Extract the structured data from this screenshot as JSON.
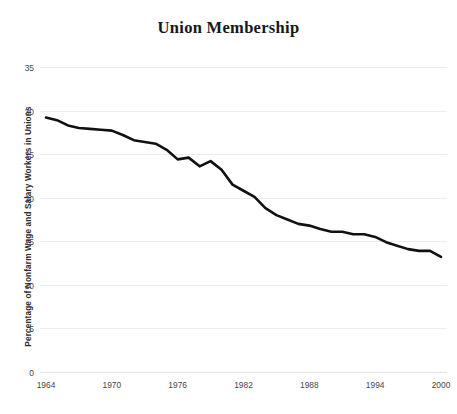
{
  "chart_data": {
    "type": "line",
    "title": "Union Membership",
    "xlabel": "",
    "ylabel": "Percentage of Nonfarm Wage and Salary Workers in Unions",
    "xlim": [
      1964,
      2000
    ],
    "ylim": [
      0,
      35
    ],
    "grid": true,
    "legend": false,
    "y_ticks": [
      0,
      5,
      10,
      15,
      20,
      25,
      30,
      35
    ],
    "y_tick_labels": [
      "0",
      "5",
      "10",
      "15",
      "20",
      "25",
      "30",
      "35"
    ],
    "x_ticks": [
      1964,
      1970,
      1976,
      1982,
      1988,
      1994,
      2000
    ],
    "x_tick_labels": [
      "1964",
      "1970",
      "1976",
      "1982",
      "1988",
      "1994",
      "2000"
    ],
    "series": [
      {
        "name": "Union Membership",
        "color": "#111111",
        "x": [
          1964,
          1965,
          1966,
          1967,
          1968,
          1969,
          1970,
          1971,
          1972,
          1973,
          1974,
          1975,
          1976,
          1977,
          1978,
          1979,
          1980,
          1981,
          1982,
          1983,
          1984,
          1985,
          1986,
          1987,
          1988,
          1989,
          1990,
          1991,
          1992,
          1993,
          1994,
          1995,
          1996,
          1997,
          1998,
          1999,
          2000
        ],
        "y": [
          29.2,
          28.9,
          28.3,
          28.0,
          27.9,
          27.8,
          27.7,
          27.2,
          26.6,
          26.4,
          26.2,
          25.5,
          24.4,
          24.6,
          23.6,
          24.2,
          23.2,
          21.5,
          20.8,
          20.1,
          18.8,
          18.0,
          17.5,
          17.0,
          16.8,
          16.4,
          16.1,
          16.1,
          15.8,
          15.8,
          15.5,
          14.9,
          14.5,
          14.1,
          13.9,
          13.9,
          13.2
        ]
      }
    ]
  }
}
